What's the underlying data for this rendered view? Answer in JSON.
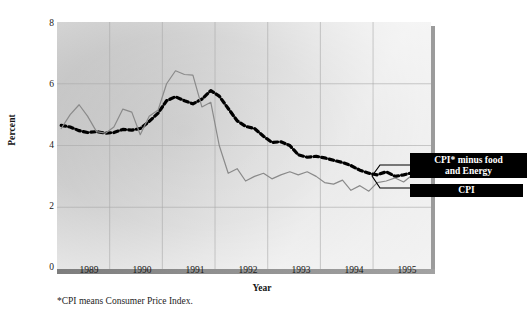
{
  "chart_data": {
    "type": "line",
    "title": "",
    "xlabel": "Year",
    "ylabel": "Percent",
    "xlim": [
      1988.5,
      1995.6
    ],
    "ylim": [
      0,
      8
    ],
    "yticks": [
      0,
      2,
      4,
      6,
      8
    ],
    "xticks": [
      1989,
      1990,
      1991,
      1992,
      1993,
      1994,
      1995
    ],
    "grid": true,
    "grid_x": [
      1989.5,
      1990.5,
      1991.5,
      1992.5,
      1993.5,
      1994.5
    ],
    "grid_y": [
      2,
      4,
      6
    ],
    "legend_position": "right-outside",
    "footnote": "*CPI means Consumer Price Index.",
    "series": [
      {
        "name": "CPI* minus food and Energy",
        "style": "dashed",
        "color": "#000000",
        "x": [
          1988.58,
          1988.75,
          1988.92,
          1989.08,
          1989.25,
          1989.42,
          1989.58,
          1989.75,
          1989.92,
          1990.08,
          1990.25,
          1990.42,
          1990.58,
          1990.75,
          1990.92,
          1991.08,
          1991.25,
          1991.42,
          1991.58,
          1991.75,
          1991.92,
          1992.08,
          1992.25,
          1992.42,
          1992.58,
          1992.75,
          1992.92,
          1993.08,
          1993.25,
          1993.42,
          1993.58,
          1993.75,
          1993.92,
          1994.08,
          1994.25,
          1994.42,
          1994.58,
          1994.75,
          1994.92,
          1995.08,
          1995.25,
          1995.42
        ],
        "y": [
          4.65,
          4.6,
          4.48,
          4.42,
          4.45,
          4.4,
          4.42,
          4.52,
          4.5,
          4.55,
          4.78,
          5.05,
          5.45,
          5.58,
          5.45,
          5.35,
          5.5,
          5.78,
          5.6,
          5.2,
          4.8,
          4.62,
          4.55,
          4.3,
          4.1,
          4.12,
          4.0,
          3.7,
          3.62,
          3.65,
          3.6,
          3.52,
          3.45,
          3.35,
          3.2,
          3.1,
          3.05,
          3.15,
          3.0,
          3.05,
          3.12,
          3.05
        ]
      },
      {
        "name": "CPI",
        "style": "solid",
        "color": "#8a8a8a",
        "x": [
          1988.58,
          1988.75,
          1988.92,
          1989.08,
          1989.25,
          1989.42,
          1989.58,
          1989.75,
          1989.92,
          1990.08,
          1990.25,
          1990.42,
          1990.58,
          1990.75,
          1990.92,
          1991.08,
          1991.25,
          1991.42,
          1991.58,
          1991.75,
          1991.92,
          1992.08,
          1992.25,
          1992.42,
          1992.58,
          1992.75,
          1992.92,
          1993.08,
          1993.25,
          1993.42,
          1993.58,
          1993.75,
          1993.92,
          1994.08,
          1994.25,
          1994.42,
          1994.58,
          1994.75,
          1994.92,
          1995.08,
          1995.25,
          1995.42
        ],
        "y": [
          4.55,
          5.0,
          5.32,
          4.95,
          4.45,
          4.4,
          4.6,
          5.18,
          5.08,
          4.35,
          4.95,
          5.15,
          6.0,
          6.42,
          6.3,
          6.28,
          5.25,
          5.4,
          4.0,
          3.1,
          3.25,
          2.85,
          3.0,
          3.1,
          2.92,
          3.05,
          3.15,
          3.05,
          3.15,
          3.0,
          2.8,
          2.75,
          2.88,
          2.55,
          2.7,
          2.52,
          2.8,
          2.85,
          2.95,
          2.82,
          3.05,
          3.1
        ]
      }
    ]
  },
  "axes": {
    "ylabel": "Percent",
    "xlabel": "Year",
    "ytick_labels": [
      "8",
      "6",
      "4",
      "2",
      "0"
    ],
    "xtick_labels": [
      "1989",
      "1990",
      "1991",
      "1992",
      "1993",
      "1994",
      "1995"
    ]
  },
  "legend": {
    "core_line1": "CPI* minus food",
    "core_line2": "and Energy",
    "cpi": "CPI"
  },
  "footnote": {
    "text": "*CPI means Consumer Price Index."
  },
  "colors": {
    "cpi_line": "#8a8a8a",
    "core_line": "#000000",
    "legend_bg": "#000000",
    "legend_text": "#ffffff",
    "grid": "#a9a9a9",
    "axis_bar": "#8b8b8b"
  }
}
